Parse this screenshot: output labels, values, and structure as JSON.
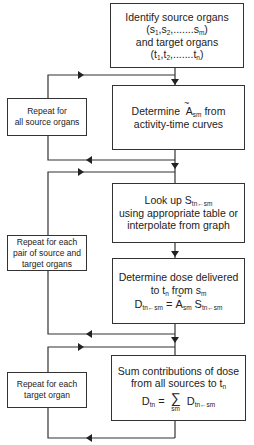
{
  "boxes": {
    "identify": {
      "line1": "Identify source organs",
      "line2": "(s1,s2,.......sm)",
      "line3": "and target organs",
      "line4": "(t1,t2,.......tn)"
    },
    "determine_a": {
      "line1_pre": "Determine",
      "symbol": "A",
      "symbol_sub": "sm",
      "line1_post": "from",
      "line2": "activity-time curves"
    },
    "lookup": {
      "line1_pre": "Look up S",
      "line1_sub": "tn←sm",
      "line2": "using appropriate table or",
      "line3": "interpolate from graph"
    },
    "dose": {
      "line1": "Determine dose delivered",
      "line2": "to tn from sm",
      "eq_lhs": "D",
      "eq_lhs_sub": "tn←sm",
      "eq_eq": " = ",
      "eq_a": "A",
      "eq_a_sub": "sm",
      "eq_s": " S",
      "eq_s_sub": "tn←sm"
    },
    "sum": {
      "line1": "Sum contributions of dose",
      "line2": "from all sources to tn",
      "eq_lhs": "D",
      "eq_lhs_sub": "tn",
      "eq_eq": " = ",
      "sigma": "∑",
      "sigma_under": "sm",
      "eq_rhs": "D",
      "eq_rhs_sub": "tn←sm"
    }
  },
  "loops": {
    "source": {
      "line1": "Repeat for",
      "line2": "all source organs"
    },
    "pair": {
      "line1": "Repeat for each",
      "line2": "pair of source and",
      "line3": "target organs"
    },
    "target": {
      "line1": "Repeat for each",
      "line2": "target organ"
    }
  }
}
